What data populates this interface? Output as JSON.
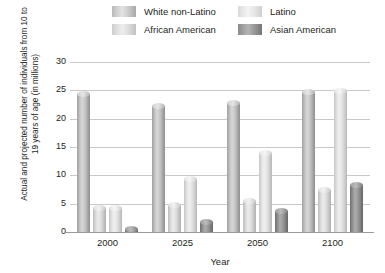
{
  "chart_data": {
    "type": "bar",
    "title": "",
    "xlabel": "Year",
    "ylabel": "Actual and projected number of individuals from 10 to 19 years of age (in millions)",
    "categories": [
      "2000",
      "2025",
      "2050",
      "2100"
    ],
    "yticks": [
      "30",
      "25",
      "20",
      "15",
      "10",
      "5",
      "0"
    ],
    "ylim": [
      0,
      30
    ],
    "grid": true,
    "legend_position": "top",
    "series": [
      {
        "name": "White non-Latino",
        "color": "#c6c6c6",
        "values": [
          24.8,
          22.8,
          23.3,
          25.3
        ]
      },
      {
        "name": "African American",
        "color": "#dedede",
        "values": [
          4.8,
          5.3,
          6.0,
          8.0
        ]
      },
      {
        "name": "Latino",
        "color": "#e9e9e9",
        "values": [
          4.7,
          9.8,
          14.5,
          25.5
        ]
      },
      {
        "name": "Asian American",
        "color": "#8d8d8d",
        "values": [
          1.0,
          2.3,
          4.2,
          8.8
        ]
      }
    ]
  },
  "axes": {
    "y_title": "Actual and projected number of individuals from 10 to 19 years of age (in millions)",
    "x_title": "Year"
  }
}
